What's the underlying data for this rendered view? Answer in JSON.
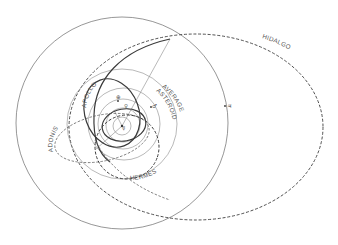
{
  "diagram": {
    "labels": {
      "hidalgo": "HIDALGO",
      "apollo": "APOLLO",
      "adonis": "ADONIS",
      "hermes": "HERMES",
      "average_line1": "AVERAGE",
      "average_line2": "ASTEROID"
    },
    "planet_symbols": {
      "jupiter": "♃",
      "mars": "♂",
      "earth": "⊕",
      "venus": "♀",
      "mercury": "☿"
    },
    "orbits": [
      {
        "name": "Jupiter",
        "style": "thin solid circle"
      },
      {
        "name": "Average asteroid",
        "style": "thin solid circle"
      },
      {
        "name": "Mars",
        "style": "thin solid circle"
      },
      {
        "name": "Earth",
        "style": "thin solid circle"
      },
      {
        "name": "Venus",
        "style": "thin solid circle"
      },
      {
        "name": "Mercury",
        "style": "thin solid circle"
      },
      {
        "name": "Hidalgo",
        "style": "dashed ellipse"
      },
      {
        "name": "Apollo",
        "style": "thick ellipse"
      },
      {
        "name": "Adonis",
        "style": "dashed ellipse"
      },
      {
        "name": "Hermes",
        "style": "dashed ellipse"
      }
    ],
    "colors": {
      "background": "#ffffff",
      "line": "#3a3a3a",
      "thin_line": "#8a8a8a",
      "text": "#555555"
    }
  }
}
